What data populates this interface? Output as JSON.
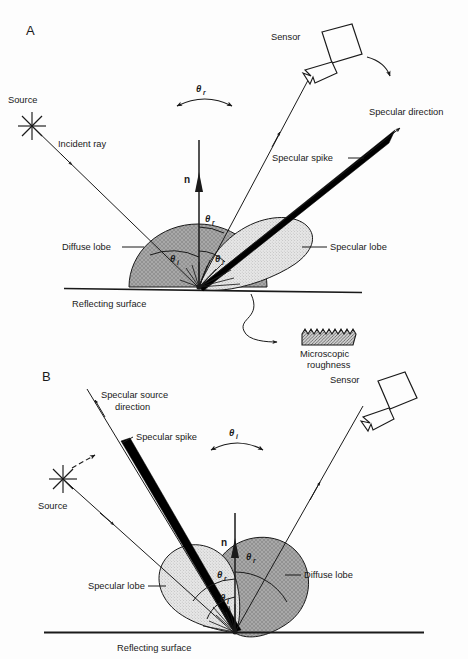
{
  "figure": {
    "title_visible": false,
    "background_color": "#fdfdfd",
    "ink_color": "#1a1a1a"
  },
  "colors": {
    "diffuse_lobe_fill": "#a8a8a8",
    "specular_lobe_fill": "#e2e2e2",
    "specular_spike_fill": "#000000",
    "roughness_fill": "#c9c9c9",
    "line": "#1a1a1a"
  },
  "panels": [
    {
      "id": "A",
      "label": "A",
      "description": "Fixed source, moving sensor",
      "labels": {
        "source": "Source",
        "incident_ray": "Incident ray",
        "normal": "n",
        "sensor": "Sensor",
        "specular_direction": "Specular direction",
        "specular_spike": "Specular spike",
        "specular_lobe": "Specular lobe",
        "diffuse_lobe": "Diffuse lobe",
        "reflecting_surface": "Reflecting surface",
        "microscopic_roughness_line1": "Microscopic",
        "microscopic_roughness_line2": "roughness",
        "sweep_angle": "θ",
        "sweep_angle_sub": "r",
        "theta_i": "θ",
        "theta_i_sub": "i",
        "theta_r": "θ",
        "theta_r_sub": "r",
        "theta_i2": "θ",
        "theta_i2_sub": "i"
      }
    },
    {
      "id": "B",
      "label": "B",
      "description": "Moving source, fixed sensor",
      "labels": {
        "source": "Source",
        "specular_source_direction_line1": "Specular source",
        "specular_source_direction_line2": "direction",
        "specular_spike": "Specular spike",
        "normal": "n",
        "sensor": "Sensor",
        "specular_lobe": "Specular lobe",
        "diffuse_lobe": "Diffuse lobe",
        "reflecting_surface": "Reflecting surface",
        "sweep_angle": "θ",
        "sweep_angle_sub": "i",
        "theta_r_outer": "θ",
        "theta_r_outer_sub": "r",
        "theta_r_inner": "θ",
        "theta_r_inner_sub": "r",
        "theta_i": "θ",
        "theta_i_sub": "i"
      }
    }
  ],
  "icons": {
    "source": "starburst-icon",
    "sensor": "sensor-box-icon",
    "rotation_arrow": "curved-double-arrow-icon",
    "roughness": "jagged-hatched-bar-icon"
  }
}
